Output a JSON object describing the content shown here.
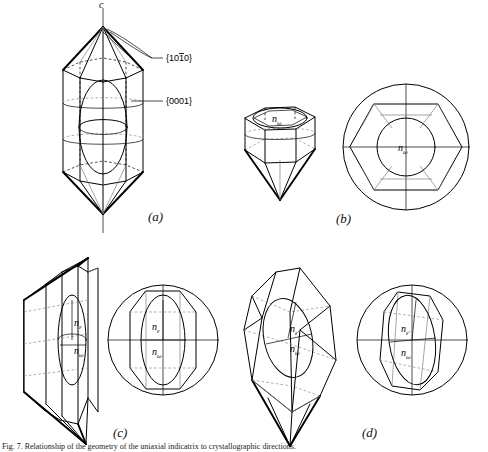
{
  "figure": {
    "axis_label_c": "c",
    "miller_prism": "{1010}",
    "miller_basal": "{0001}",
    "panel_letters": [
      "(a)",
      "(b)",
      "(c)",
      "(d)"
    ],
    "caption": "Fig. 7. Relationship of the geometry of the uniaxial indicatrix to crystallographic directions.",
    "colors": {
      "ink": "#000000",
      "light_ink": "#6f6f6f",
      "background": "#ffffff"
    },
    "refractive_indices": {
      "omega": "n",
      "omega_sub": "ω",
      "epsilon": "n",
      "epsilon_sub": "ε",
      "epsilon_prime_sub": "ε'"
    },
    "panels": [
      {
        "id": "a",
        "letter": "(a)",
        "description": "Hexagonal prism with bipyramidal terminations, c-axis vertical, indicatrix shown as prolate ellipsoid inside",
        "labels": [
          "c",
          "{1010}",
          "{0001}"
        ],
        "view": "side view, c-axis vertical"
      },
      {
        "id": "b",
        "letter": "(b)",
        "description": "Crystal viewed down the c axis (optic axis); circular section of the indicatrix with radius n-omega",
        "labels": [
          "nω"
        ],
        "view": "down optic axis"
      },
      {
        "id": "c",
        "letter": "(c)",
        "description": "Crystal viewed perpendicular to c; principal section of the indicatrix showing n-epsilon vertical and n-omega horizontal",
        "labels": [
          "nε",
          "nω"
        ],
        "view": "perpendicular to optic axis"
      },
      {
        "id": "d",
        "letter": "(d)",
        "description": "Crystal in random orientation; elliptical section of the indicatrix showing n-epsilon-prime and n-omega",
        "labels": [
          "nε'",
          "nω"
        ],
        "view": "random / inclined orientation"
      }
    ]
  }
}
